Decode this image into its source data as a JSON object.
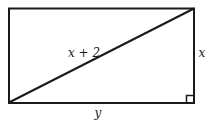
{
  "diagram": {
    "type": "geometry",
    "shape": "rectangle-with-diagonal",
    "stroke_color": "#1a1a1a",
    "background": "#ffffff",
    "labels": {
      "diagonal": "x + 2",
      "right_side": "x",
      "bottom_side": "y"
    },
    "right_angle_marker": {
      "corner": "bottom-right"
    }
  }
}
